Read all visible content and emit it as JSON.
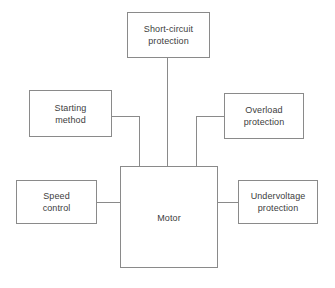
{
  "diagram": {
    "background_color": "#ffffff",
    "line_color": "#8a8a8a",
    "text_color": "#3d3d3d",
    "nodes": [
      {
        "id": "short-circuit",
        "label": "Short-circuit\nprotection"
      },
      {
        "id": "starting-method",
        "label": "Starting\nmethod"
      },
      {
        "id": "overload",
        "label": "Overload\nprotection"
      },
      {
        "id": "speed-control",
        "label": "Speed\ncontrol"
      },
      {
        "id": "undervoltage",
        "label": "Undervoltage\nprotection"
      },
      {
        "id": "motor",
        "label": "Motor"
      }
    ],
    "connections": [
      {
        "from": "short-circuit",
        "to": "motor",
        "style": "straight-vertical"
      },
      {
        "from": "starting-method",
        "to": "motor",
        "style": "elbow-right-down"
      },
      {
        "from": "overload",
        "to": "motor",
        "style": "elbow-left-down"
      },
      {
        "from": "speed-control",
        "to": "motor",
        "style": "straight-horizontal"
      },
      {
        "from": "motor",
        "to": "undervoltage",
        "style": "straight-horizontal"
      }
    ]
  }
}
